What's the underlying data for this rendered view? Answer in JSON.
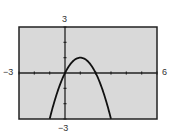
{
  "chart_data": {
    "type": "line",
    "title": "",
    "xlabel": "",
    "ylabel": "",
    "function": "y = 2x - x^2",
    "xlim": [
      -3,
      6
    ],
    "ylim": [
      -3,
      3
    ],
    "xtick_step": 1,
    "ytick_step": 1,
    "grid": false,
    "legend": null,
    "window_labels": {
      "xmin": "−3",
      "xmax": "6",
      "ymin": "−3",
      "ymax": "3"
    },
    "series": [
      {
        "name": "curve",
        "x": [
          -1,
          -0.5,
          0,
          0.5,
          1,
          1.5,
          2,
          2.5,
          3
        ],
        "y": [
          -3,
          -1.25,
          0,
          0.75,
          1,
          0.75,
          0,
          -1.25,
          -3
        ]
      }
    ],
    "colors": {
      "plot_background": "#d9d9d9",
      "frame": "#222222",
      "axes": "#222222",
      "curve": "#111111"
    }
  }
}
